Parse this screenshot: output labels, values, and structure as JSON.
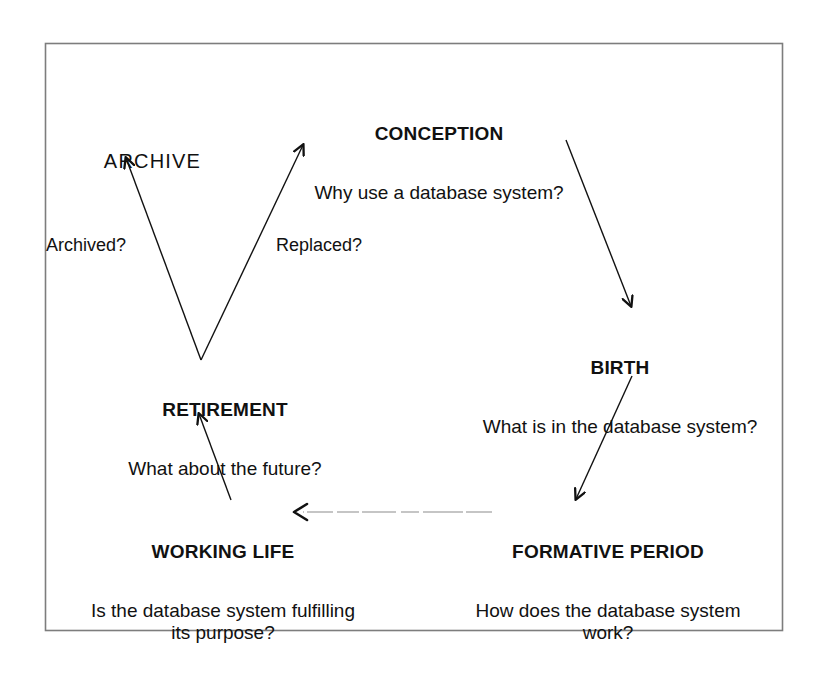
{
  "diagram": {
    "kind": "database-system-life-cycle",
    "frame": {
      "x": 45,
      "y": 43,
      "width": 738,
      "height": 588,
      "stroke": "#777777"
    },
    "ink_color": "#111111",
    "nodes": [
      {
        "id": "conception",
        "title": "CONCEPTION",
        "title_style": "bold",
        "subtitle": "Why use a database system?"
      },
      {
        "id": "birth",
        "title": "BIRTH",
        "title_style": "bold",
        "subtitle": "What is in the database system?"
      },
      {
        "id": "formative",
        "title": "FORMATIVE PERIOD",
        "title_style": "bold",
        "subtitle": "How does the database system\nwork?"
      },
      {
        "id": "working",
        "title": "WORKING LIFE",
        "title_style": "bold",
        "subtitle": "Is the database system fulfilling\nits purpose?"
      },
      {
        "id": "retirement",
        "title": "RETIREMENT",
        "title_style": "bold",
        "subtitle": "What about the future?"
      },
      {
        "id": "archive",
        "title": "ARCHIVE",
        "title_style": "plain",
        "subtitle": ""
      }
    ],
    "edges": [
      {
        "id": "conception-to-birth",
        "from": "conception",
        "to": "birth",
        "label": "",
        "style": "solid",
        "x1": 566,
        "y1": 140,
        "x2": 631,
        "y2": 308
      },
      {
        "id": "birth-to-formative",
        "from": "birth",
        "to": "formative",
        "label": "",
        "style": "solid",
        "x1": 632,
        "y1": 376,
        "x2": 575,
        "y2": 501
      },
      {
        "id": "formative-to-working",
        "from": "formative",
        "to": "working",
        "label": "",
        "style": "dashed-faint",
        "x1": 492,
        "y1": 512,
        "x2": 300,
        "y2": 512
      },
      {
        "id": "working-to-retirement",
        "from": "working",
        "to": "retirement",
        "label": "",
        "style": "solid",
        "x1": 231,
        "y1": 500,
        "x2": 198,
        "y2": 412
      },
      {
        "id": "retirement-to-archive",
        "from": "retirement",
        "to": "archive",
        "label": "Archived?",
        "style": "solid",
        "x1": 201,
        "y1": 360,
        "x2": 125,
        "y2": 156
      },
      {
        "id": "retirement-to-conception",
        "from": "retirement",
        "to": "conception",
        "label": "Replaced?",
        "style": "solid",
        "x1": 201,
        "y1": 360,
        "x2": 304,
        "y2": 143
      }
    ],
    "edge_labels": [
      {
        "id": "archived",
        "text": "Archived?"
      },
      {
        "id": "replaced",
        "text": "Replaced?"
      }
    ]
  }
}
